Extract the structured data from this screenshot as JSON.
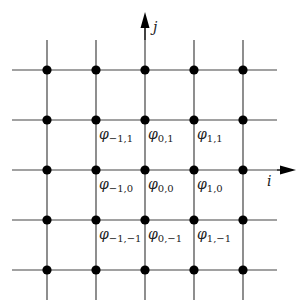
{
  "diagram": {
    "type": "finite-difference grid stencil",
    "colors": {
      "grid_line": "#333333",
      "node": "#000000",
      "text": "#222222",
      "background": "#ffffff"
    },
    "axes": {
      "i": {
        "label": "i",
        "direction": "horizontal"
      },
      "j": {
        "label": "j",
        "direction": "vertical"
      }
    },
    "grid": {
      "columns_x": [
        47,
        96,
        145,
        194,
        243
      ],
      "rows_y": [
        70,
        120,
        170,
        220,
        270
      ],
      "origin_index": {
        "col": 2,
        "row": 2
      }
    },
    "labels": [
      {
        "symbol": "φ",
        "sub": "−1,1",
        "x": 96,
        "y": 120
      },
      {
        "symbol": "φ",
        "sub": "0,1",
        "x": 145,
        "y": 120
      },
      {
        "symbol": "φ",
        "sub": "1,1",
        "x": 194,
        "y": 120
      },
      {
        "symbol": "φ",
        "sub": "−1,0",
        "x": 96,
        "y": 170
      },
      {
        "symbol": "φ",
        "sub": "0,0",
        "x": 145,
        "y": 170
      },
      {
        "symbol": "φ",
        "sub": "1,0",
        "x": 194,
        "y": 170
      },
      {
        "symbol": "φ",
        "sub": "−1,−1",
        "x": 96,
        "y": 220
      },
      {
        "symbol": "φ",
        "sub": "0,−1",
        "x": 145,
        "y": 220
      },
      {
        "symbol": "φ",
        "sub": "1,−1",
        "x": 194,
        "y": 220
      }
    ]
  }
}
